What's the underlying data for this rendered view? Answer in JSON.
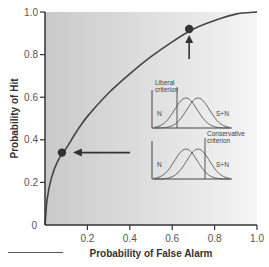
{
  "chart_data": {
    "type": "line",
    "title": "",
    "xlabel": "Probability of False Alarm",
    "ylabel": "Probability of Hit",
    "xlim": [
      0,
      1.0
    ],
    "ylim": [
      0,
      1.0
    ],
    "x_ticks": [
      0.2,
      0.4,
      0.6,
      0.8,
      1.0
    ],
    "x_tick_labels": [
      "0.2",
      "0.4",
      "0.6",
      "0.8",
      "1.0"
    ],
    "y_ticks": [
      0,
      0.2,
      0.4,
      0.6,
      0.8,
      1.0
    ],
    "y_tick_labels": [
      "0",
      "0.2",
      "0.4",
      "0.6",
      "0.8",
      "1.0"
    ],
    "grid": false,
    "series": [
      {
        "name": "ROC curve",
        "x": [
          0,
          0.01,
          0.03,
          0.06,
          0.1,
          0.15,
          0.2,
          0.3,
          0.4,
          0.5,
          0.6,
          0.7,
          0.8,
          0.9,
          1.0
        ],
        "y": [
          0,
          0.12,
          0.22,
          0.3,
          0.36,
          0.44,
          0.51,
          0.62,
          0.71,
          0.79,
          0.86,
          0.92,
          0.96,
          0.99,
          1.0
        ]
      }
    ],
    "points": [
      {
        "name": "liberal-criterion-point",
        "x": 0.68,
        "y": 0.92
      },
      {
        "name": "conservative-criterion-point",
        "x": 0.08,
        "y": 0.34
      }
    ],
    "insets": [
      {
        "name": "liberal",
        "label_line1": "Liberal",
        "label_line2": "criterion",
        "noise_label": "N",
        "signal_label": "S+N",
        "criterion": "left"
      },
      {
        "name": "conservative",
        "label_line1": "Conservative",
        "label_line2": "criterion",
        "noise_label": "N",
        "signal_label": "S+N",
        "criterion": "right"
      }
    ],
    "colors": {
      "curve": "#444444",
      "point": "#333333",
      "axis": "#333333",
      "background_left": "#cfcfcf",
      "background_right": "#f4f4f4"
    }
  }
}
